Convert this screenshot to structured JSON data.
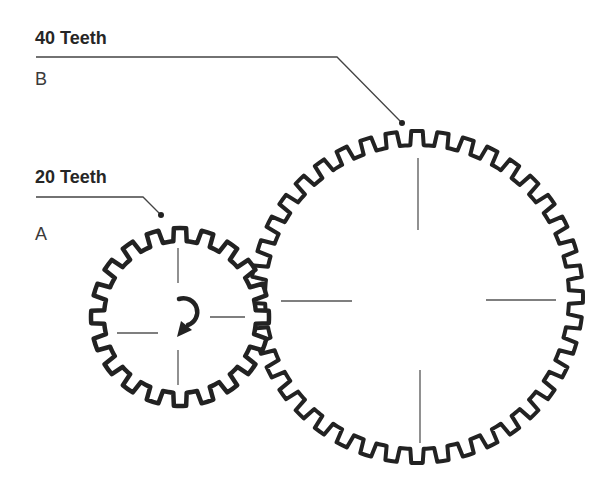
{
  "colors": {
    "gear_stroke": "#222222",
    "leader_line": "#444444",
    "crosshair": "#555555",
    "background": "#ffffff"
  },
  "gears": [
    {
      "id": "A",
      "name": "A",
      "teeth_label": "20 Teeth",
      "teeth": 20,
      "center": [
        180,
        317
      ],
      "tip_radius": 89,
      "root_radius": 76,
      "rotation_offset_deg": -9,
      "crosshair": {
        "top": [
          [
            178,
            248
          ],
          [
            178,
            283
          ]
        ],
        "bottom": [
          [
            178,
            350
          ],
          [
            178,
            385
          ]
        ],
        "left": [
          [
            117,
            333
          ],
          [
            158,
            333
          ]
        ],
        "right": [
          [
            210,
            317
          ],
          [
            245,
            317
          ]
        ]
      },
      "rotation_arrow": "clockwise",
      "leader": {
        "points": [
          [
            36,
            197
          ],
          [
            143,
            197
          ],
          [
            161,
            215
          ]
        ],
        "dot": [
          161,
          215
        ]
      }
    },
    {
      "id": "B",
      "name": "B",
      "teeth_label": "40 Teeth",
      "teeth": 40,
      "center": [
        417,
        297
      ],
      "tip_radius": 166,
      "root_radius": 152,
      "rotation_offset_deg": -4.5,
      "crosshair": {
        "top": [
          [
            418,
            158
          ],
          [
            418,
            230
          ]
        ],
        "bottom": [
          [
            420,
            370
          ],
          [
            420,
            443
          ]
        ],
        "left": [
          [
            281,
            301
          ],
          [
            352,
            301
          ]
        ],
        "right": [
          [
            486,
            300
          ],
          [
            556,
            300
          ]
        ]
      },
      "leader": {
        "points": [
          [
            36,
            57
          ],
          [
            337,
            57
          ],
          [
            402,
            123
          ]
        ],
        "dot": [
          402,
          123
        ]
      }
    }
  ]
}
